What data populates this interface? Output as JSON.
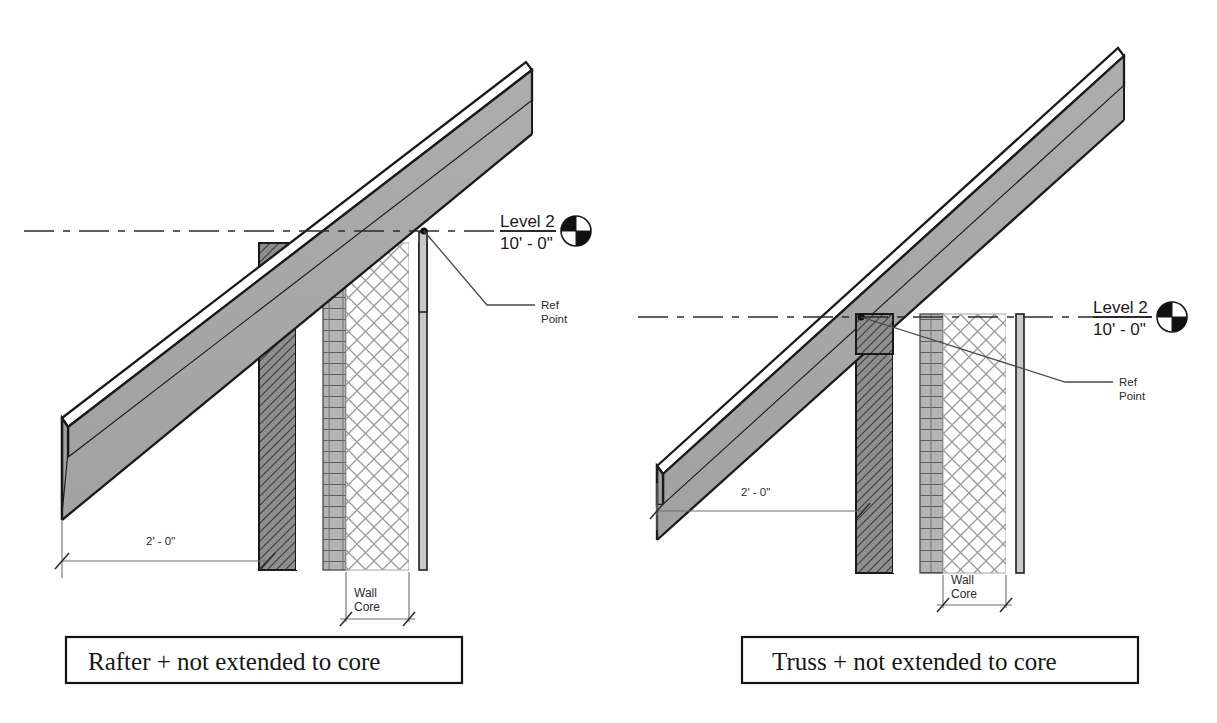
{
  "sheet": {
    "background_color": "#fefefe",
    "line_color": "#1a1a1a"
  },
  "palette": {
    "roof_fill": "#a8a8a8",
    "roof_edge": "#1a1a1a",
    "sheathing_fill": "#ffffff",
    "layer_dark_hatch_fill": "#8e8e8e",
    "layer_block_fill": "#b4b4b4",
    "layer_crosshatch_fill": "#fdfdfd",
    "layer_thin_fill": "#c9c9c9",
    "annotation_color": "#2b2b2b",
    "dim_line_color": "#6e6e6e"
  },
  "details": [
    {
      "id": "detail-rafter",
      "caption": "Rafter + not extended to core",
      "level_marker": {
        "name": "Level 2",
        "elevation": "10' - 0\"",
        "symbol": "quadrant-circle-icon"
      },
      "ref_point_label_line1": "Ref",
      "ref_point_label_line2": "Point",
      "overhang_dimension": "2' - 0\"",
      "core_label_line1": "Wall",
      "core_label_line2": "Core",
      "roof_type": "rafter",
      "note": "Roof structure bears on wall outer layer; reference point at top of wall exterior face."
    },
    {
      "id": "detail-truss",
      "caption": "Truss + not extended to core",
      "level_marker": {
        "name": "Level 2",
        "elevation": "10' - 0\"",
        "symbol": "quadrant-circle-icon"
      },
      "ref_point_label_line1": "Ref",
      "ref_point_label_line2": "Point",
      "overhang_dimension": "2' - 0\"",
      "core_label_line1": "Wall",
      "core_label_line2": "Core",
      "roof_type": "truss",
      "note": "Truss top chord only; reference point at top of wall exterior face."
    }
  ],
  "wall_layers": [
    {
      "name": "exterior-cladding",
      "pattern": "diagonal-hatch",
      "fill": "#8e8e8e"
    },
    {
      "name": "air-gap",
      "pattern": "none",
      "fill": "#ffffff"
    },
    {
      "name": "masonry-block",
      "pattern": "block-grid",
      "fill": "#b4b4b4"
    },
    {
      "name": "wall-core-insulation",
      "pattern": "cross-hatch",
      "fill": "#fdfdfd"
    },
    {
      "name": "interior-finish",
      "pattern": "solid-thin",
      "fill": "#c9c9c9"
    }
  ]
}
